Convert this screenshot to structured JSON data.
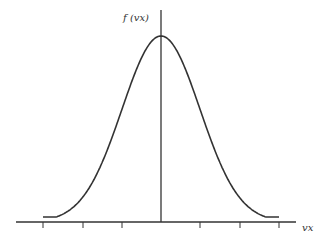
{
  "diagram": {
    "y_label": "f (vx)",
    "x_label": "vx",
    "curve": "bell-shaped (normal) distribution centered at vx = 0",
    "ticks_count": 7,
    "colors": {
      "line": "#333333",
      "background": "#ffffff"
    }
  }
}
